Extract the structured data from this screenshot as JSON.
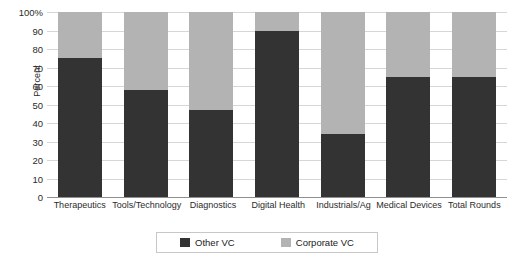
{
  "chart_data": {
    "type": "bar",
    "stacked": true,
    "stack_mode": "percent",
    "title": "",
    "subtitle": "",
    "xlabel": "",
    "ylabel": "Percent",
    "ylim": [
      0,
      100
    ],
    "ytick_labels": [
      "100%",
      "90",
      "80",
      "70",
      "60",
      "50",
      "40",
      "30",
      "20",
      "10",
      "0"
    ],
    "ytick_values": [
      100,
      90,
      80,
      70,
      60,
      50,
      40,
      30,
      20,
      10,
      0
    ],
    "grid": true,
    "legend_position": "bottom",
    "categories": [
      "Therapeutics",
      "Tools/Technology",
      "Diagnostics",
      "Digital Health",
      "Industrials/Ag",
      "Medical Devices",
      "Total Rounds"
    ],
    "series": [
      {
        "name": "Other VC",
        "color": "#333333",
        "values": [
          75,
          58,
          47,
          90,
          34,
          65,
          65
        ]
      },
      {
        "name": "Corporate VC",
        "color": "#b3b3b3",
        "values": [
          25,
          42,
          53,
          10,
          66,
          35,
          35
        ]
      }
    ]
  },
  "legend": {
    "entries": [
      {
        "label": "Other VC",
        "color": "#333333"
      },
      {
        "label": "Corporate VC",
        "color": "#b3b3b3"
      }
    ]
  },
  "axes": {
    "y_title": "Percent"
  },
  "colors": {
    "other_vc": "#333333",
    "corporate_vc": "#b3b3b3",
    "gridline": "#d6d6d6",
    "baseline": "#8f8f8f",
    "legend_border": "#c8c8c8",
    "background": "#ffffff",
    "text": "#2b2b2b"
  }
}
